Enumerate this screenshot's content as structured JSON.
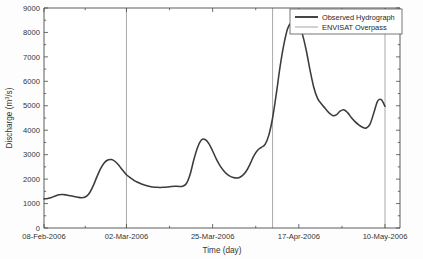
{
  "chart_data": {
    "type": "line",
    "title": "",
    "xlabel": "Time (day)",
    "ylabel": "Discharge (m3/s)",
    "ylabel_base": "Discharge (m",
    "ylabel_sup": "3",
    "ylabel_tail": "/s)",
    "ylim": [
      0,
      9000
    ],
    "ytick_labels": [
      "0",
      "1000",
      "2000",
      "3000",
      "4000",
      "5000",
      "6000",
      "7000",
      "8000",
      "9000"
    ],
    "ytick_values": [
      0,
      1000,
      2000,
      3000,
      4000,
      5000,
      6000,
      7000,
      8000,
      9000
    ],
    "xtick_labels": [
      "08-Feb-2006",
      "02-Mar-2006",
      "25-Mar-2006",
      "17-Apr-2006",
      "10-May-2006"
    ],
    "xtick_values": [
      0,
      22,
      45,
      68,
      91
    ],
    "xlim": [
      0,
      95
    ],
    "grid": false,
    "legend_position": "top-right",
    "legend": [
      {
        "name": "Observed Hydrograph",
        "style": "thick-dark-line",
        "color": "#3b3b3b"
      },
      {
        "name": "ENVISAT Overpass",
        "style": "thin-gray-line",
        "color": "#9a9a9a"
      }
    ],
    "series": [
      {
        "name": "Observed Hydrograph",
        "color": "#3b3b3b",
        "x": [
          0,
          1,
          2,
          3,
          4,
          5,
          6,
          7,
          8,
          9,
          10,
          11,
          12,
          13,
          14,
          15,
          16,
          17,
          18,
          19,
          20,
          21,
          22,
          23,
          24,
          25,
          26,
          27,
          28,
          29,
          30,
          31,
          32,
          33,
          34,
          35,
          36,
          37,
          38,
          39,
          40,
          41,
          42,
          43,
          44,
          45,
          46,
          47,
          48,
          49,
          50,
          51,
          52,
          53,
          54,
          55,
          56,
          57,
          58,
          59,
          60,
          61,
          62,
          63,
          64,
          65,
          66,
          67,
          68,
          69,
          70,
          71,
          72,
          73,
          74,
          75,
          76,
          77,
          78,
          79,
          80,
          81,
          82,
          83,
          84,
          85,
          86,
          87,
          88,
          89,
          90,
          91
        ],
        "y": [
          1190,
          1210,
          1250,
          1310,
          1360,
          1370,
          1350,
          1320,
          1290,
          1260,
          1240,
          1270,
          1400,
          1680,
          2050,
          2400,
          2650,
          2780,
          2800,
          2720,
          2560,
          2360,
          2180,
          2060,
          1950,
          1870,
          1800,
          1750,
          1710,
          1680,
          1665,
          1660,
          1665,
          1680,
          1700,
          1710,
          1700,
          1710,
          1820,
          2200,
          2800,
          3300,
          3600,
          3620,
          3450,
          3150,
          2820,
          2540,
          2330,
          2180,
          2090,
          2050,
          2060,
          2150,
          2330,
          2620,
          2950,
          3180,
          3300,
          3420,
          3800,
          4500,
          5500,
          6600,
          7500,
          8150,
          8420,
          8450,
          8300,
          7900,
          7250,
          6450,
          5750,
          5300,
          5080,
          4900,
          4720,
          4600,
          4630,
          4780,
          4840,
          4720,
          4520,
          4350,
          4220,
          4120,
          4090,
          4250,
          4700,
          5180,
          5250,
          4980
        ]
      }
    ],
    "overpasses": [
      {
        "label": "ENVISAT Overpass",
        "x": 22
      },
      {
        "label": "ENVISAT Overpass",
        "x": 61
      },
      {
        "label": "ENVISAT Overpass",
        "x": 91
      }
    ]
  }
}
